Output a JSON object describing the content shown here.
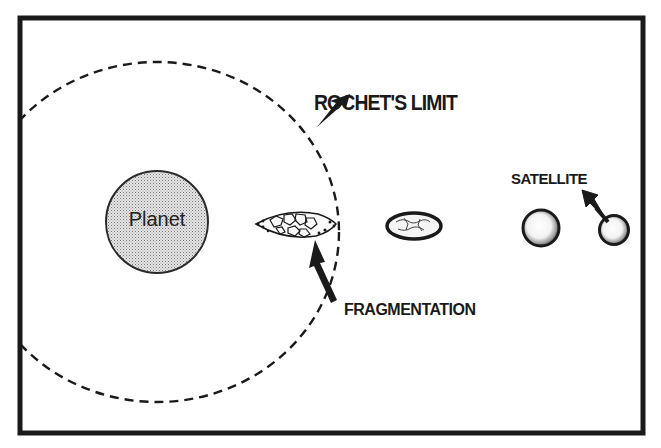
{
  "diagram": {
    "labels": {
      "rochet_limit": "ROCHET'S LIMIT",
      "planet": "Planet",
      "satellite": "SATELLITE",
      "fragmentation": "FRAGMENTATION"
    },
    "colors": {
      "ink": "#1a1a1a",
      "planet_fill": "#d4d4d4",
      "background": "#ffffff"
    },
    "elements": [
      {
        "id": "frame",
        "type": "rect"
      },
      {
        "id": "roche-limit-boundary",
        "type": "dashed-ellipse"
      },
      {
        "id": "planet",
        "type": "circle"
      },
      {
        "id": "fragmenting-body",
        "type": "fragment-cluster"
      },
      {
        "id": "elongated-satellite",
        "type": "ellipse"
      },
      {
        "id": "satellite-near",
        "type": "sphere"
      },
      {
        "id": "satellite",
        "type": "sphere"
      }
    ],
    "arrows": [
      {
        "from": "ROCHET'S LIMIT",
        "to": "roche-limit-boundary"
      },
      {
        "from": "SATELLITE",
        "to": "satellite"
      },
      {
        "from": "FRAGMENTATION",
        "to": "fragmenting-body"
      }
    ]
  }
}
